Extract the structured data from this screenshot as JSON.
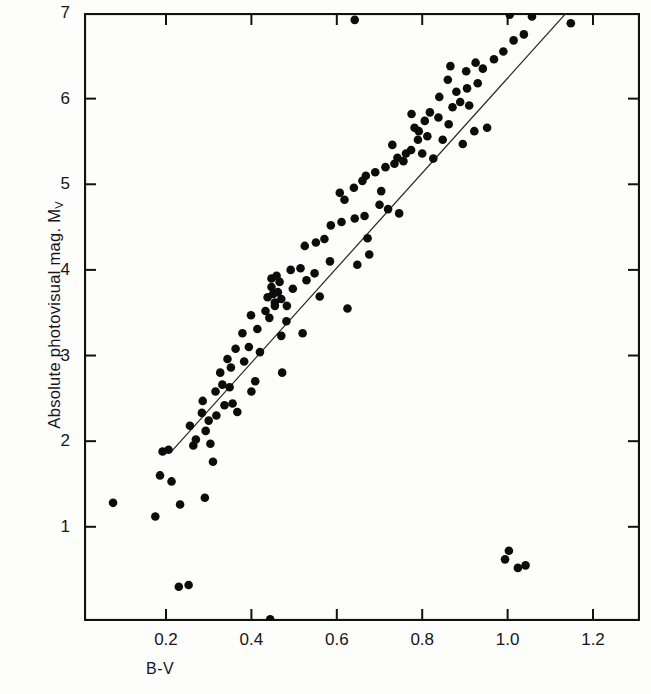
{
  "figure": {
    "background_color": "#fdfdfc",
    "ink_color": "#111111",
    "frame": {
      "left_px": 84,
      "top_px": 13,
      "right_px": 640,
      "bottom_px": 621
    }
  },
  "axis_labels": {
    "x_title": "B-V",
    "y_title_main": "Absolute photovisual mag. M",
    "y_title_sub": "V"
  },
  "chart_data": {
    "type": "scatter",
    "title": "",
    "subtitle": "",
    "xlabel": "B-V",
    "ylabel": "Absolute photovisual mag. M_V",
    "xlim": [
      0.008,
      1.31
    ],
    "ylim": [
      7.0,
      -0.1
    ],
    "y_inverted": true,
    "grid": false,
    "legend": null,
    "xticks": [
      0.2,
      0.4,
      0.6,
      0.8,
      1.0,
      1.2
    ],
    "xtick_labels": [
      "0.2",
      "0.4",
      "0.6",
      "0.8",
      "1.0",
      "1.2"
    ],
    "yticks": [
      1,
      2,
      3,
      4,
      5,
      6,
      7
    ],
    "ytick_labels": [
      "1",
      "2",
      "3",
      "4",
      "5",
      "6",
      "7"
    ],
    "ticks_on_all_sides": true,
    "marker": {
      "shape": "circle",
      "color": "#0c0c0c",
      "radius_px": 4.3
    },
    "series": [
      {
        "name": "stars",
        "marker_color": "#0c0c0c",
        "points": [
          [
            0.253,
            0.32
          ],
          [
            0.444,
            -0.08
          ],
          [
            0.076,
            1.28
          ],
          [
            0.175,
            1.12
          ],
          [
            0.233,
            1.26
          ],
          [
            0.291,
            1.34
          ],
          [
            0.213,
            1.53
          ],
          [
            0.186,
            1.6
          ],
          [
            0.264,
            1.95
          ],
          [
            0.27,
            2.02
          ],
          [
            0.31,
            1.76
          ],
          [
            0.304,
            1.97
          ],
          [
            0.256,
            2.18
          ],
          [
            0.3,
            2.24
          ],
          [
            0.284,
            2.33
          ],
          [
            0.318,
            2.3
          ],
          [
            0.286,
            2.47
          ],
          [
            0.337,
            2.42
          ],
          [
            0.356,
            2.44
          ],
          [
            0.316,
            2.58
          ],
          [
            0.332,
            2.66
          ],
          [
            0.349,
            2.63
          ],
          [
            0.4,
            2.58
          ],
          [
            0.327,
            2.8
          ],
          [
            0.352,
            2.86
          ],
          [
            0.344,
            2.96
          ],
          [
            0.383,
            2.93
          ],
          [
            0.472,
            2.8
          ],
          [
            0.363,
            3.08
          ],
          [
            0.394,
            3.1
          ],
          [
            0.42,
            3.04
          ],
          [
            0.379,
            3.26
          ],
          [
            0.414,
            3.31
          ],
          [
            0.47,
            3.23
          ],
          [
            0.52,
            3.26
          ],
          [
            0.399,
            3.47
          ],
          [
            0.433,
            3.52
          ],
          [
            0.442,
            3.44
          ],
          [
            0.455,
            3.58
          ],
          [
            0.438,
            3.68
          ],
          [
            0.451,
            3.72
          ],
          [
            0.462,
            3.74
          ],
          [
            0.447,
            3.8
          ],
          [
            0.466,
            3.86
          ],
          [
            0.497,
            3.78
          ],
          [
            0.56,
            3.69
          ],
          [
            0.625,
            3.55
          ],
          [
            0.492,
            4.0
          ],
          [
            0.515,
            4.02
          ],
          [
            0.548,
            3.96
          ],
          [
            0.584,
            4.1
          ],
          [
            0.648,
            4.06
          ],
          [
            0.676,
            4.18
          ],
          [
            0.525,
            4.28
          ],
          [
            0.551,
            4.32
          ],
          [
            0.672,
            4.37
          ],
          [
            0.586,
            4.52
          ],
          [
            0.611,
            4.56
          ],
          [
            0.642,
            4.6
          ],
          [
            0.665,
            4.63
          ],
          [
            0.7,
            4.76
          ],
          [
            0.72,
            4.71
          ],
          [
            0.746,
            4.66
          ],
          [
            0.607,
            4.9
          ],
          [
            0.64,
            4.96
          ],
          [
            0.704,
            4.92
          ],
          [
            0.668,
            5.1
          ],
          [
            0.69,
            5.14
          ],
          [
            0.714,
            5.2
          ],
          [
            0.735,
            5.24
          ],
          [
            0.742,
            5.31
          ],
          [
            0.756,
            5.27
          ],
          [
            0.762,
            5.36
          ],
          [
            0.774,
            5.4
          ],
          [
            0.8,
            5.36
          ],
          [
            0.826,
            5.3
          ],
          [
            0.79,
            5.52
          ],
          [
            0.812,
            5.56
          ],
          [
            0.848,
            5.52
          ],
          [
            0.895,
            5.47
          ],
          [
            0.806,
            5.74
          ],
          [
            0.838,
            5.78
          ],
          [
            0.862,
            5.7
          ],
          [
            0.922,
            5.62
          ],
          [
            0.952,
            5.66
          ],
          [
            0.871,
            5.9
          ],
          [
            0.889,
            5.96
          ],
          [
            0.91,
            5.92
          ],
          [
            0.88,
            6.08
          ],
          [
            0.905,
            6.12
          ],
          [
            0.93,
            6.18
          ],
          [
            0.903,
            6.32
          ],
          [
            0.866,
            6.38
          ],
          [
            0.942,
            6.35
          ],
          [
            0.968,
            6.46
          ],
          [
            0.99,
            6.55
          ],
          [
            1.014,
            6.68
          ],
          [
            1.038,
            6.75
          ],
          [
            1.005,
            6.98
          ],
          [
            1.057,
            6.96
          ],
          [
            1.148,
            6.88
          ],
          [
            1.118,
            7.5
          ],
          [
            0.642,
            6.92
          ],
          [
            0.994,
            0.62
          ],
          [
            1.024,
            0.52
          ],
          [
            1.042,
            0.55
          ],
          [
            1.003,
            0.72
          ],
          [
            0.23,
            0.3
          ],
          [
            0.206,
            1.9
          ],
          [
            0.192,
            1.88
          ],
          [
            0.293,
            2.12
          ],
          [
            0.367,
            2.34
          ],
          [
            0.409,
            2.7
          ],
          [
            0.482,
            3.4
          ],
          [
            0.529,
            3.88
          ],
          [
            0.571,
            4.36
          ],
          [
            0.618,
            4.82
          ],
          [
            0.66,
            5.04
          ],
          [
            0.73,
            5.46
          ],
          [
            0.775,
            5.82
          ],
          [
            0.84,
            6.02
          ],
          [
            0.86,
            6.22
          ],
          [
            0.925,
            6.42
          ],
          [
            0.455,
            3.62
          ],
          [
            0.47,
            3.66
          ],
          [
            0.447,
            3.9
          ],
          [
            0.459,
            3.93
          ],
          [
            0.483,
            3.58
          ],
          [
            0.792,
            5.62
          ],
          [
            0.782,
            5.66
          ],
          [
            0.818,
            5.84
          ]
        ]
      }
    ],
    "fit_line": {
      "name": "main-sequence fit",
      "style": "solid-thin",
      "color": "#2b2b2b",
      "start": [
        0.213,
        1.88
      ],
      "end": [
        1.195,
        7.32
      ]
    }
  }
}
